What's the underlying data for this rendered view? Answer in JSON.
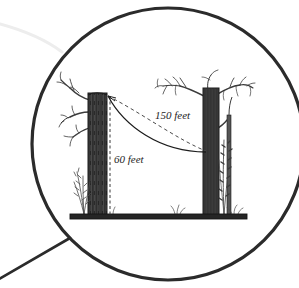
{
  "illustration": {
    "title": "Magnifying glass view of two trees connected by a cable",
    "type": "line-drawing",
    "background_color": "#ffffff",
    "ink_color": "#2b2b2b"
  },
  "magnifier": {
    "name": "magnifying-lens",
    "center_x": 168,
    "center_y": 144,
    "radius": 138,
    "stroke_color": "#2b2b2b",
    "stroke_width": 3,
    "handle": {
      "name": "magnifier-handle",
      "from_x": 68,
      "from_y": 240,
      "to_x": -6,
      "to_y": 282,
      "stroke_width": 2.4
    },
    "glint": {
      "name": "lens-glint",
      "color": "#e8e8e8"
    }
  },
  "scene": {
    "ground": {
      "label": "ground-line",
      "x": 70,
      "y": 214,
      "width": 177,
      "height": 5,
      "color": "#2b2b2b"
    },
    "left_tree": {
      "name": "left-tree",
      "trunk_x": 88,
      "trunk_top": 93,
      "trunk_bottom": 216,
      "trunk_width": 19,
      "color": "#3a3a3a"
    },
    "right_tree": {
      "name": "right-tree",
      "trunk_x": 203,
      "trunk_top": 88,
      "trunk_bottom": 216,
      "trunk_width": 16,
      "color": "#3a3a3a"
    },
    "right_sapling": {
      "name": "right-sapling",
      "trunk_x": 226,
      "trunk_top": 118,
      "trunk_bottom": 216,
      "trunk_width": 5
    }
  },
  "measurements": {
    "cable": {
      "name": "cable-curve",
      "style": "solid",
      "start_x": 108,
      "start_y": 96,
      "end_x": 206,
      "end_y": 152
    },
    "span_line": {
      "name": "span-dashed-curve",
      "style": "dashed",
      "label": "150 feet",
      "start_x": 108,
      "start_y": 96,
      "end_x": 206,
      "end_y": 152
    },
    "height_line": {
      "name": "height-dashed-line",
      "style": "dashed",
      "label": "60 feet",
      "x": 110,
      "top_y": 96,
      "bottom_y": 215
    }
  },
  "labels": {
    "span_label": {
      "text": "150 feet",
      "x": 155,
      "y": 119
    },
    "height_label": {
      "text": "60 feet",
      "x": 114,
      "y": 163
    }
  }
}
